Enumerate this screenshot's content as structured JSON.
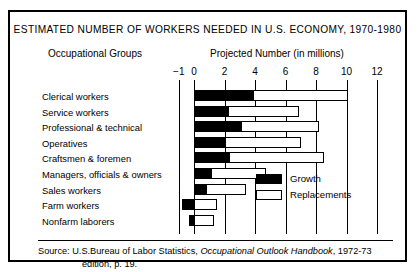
{
  "title": "ESTIMATED NUMBER OF WORKERS NEEDED IN U.S. ECONOMY, 1970-1980",
  "subheads": {
    "left": "Occupational Groups",
    "right": "Projected Number (in millions)"
  },
  "legend": {
    "growth_label": "Growth",
    "replacements_label": "Replacements"
  },
  "source": {
    "prefix": "Source:",
    "agency": "U.S.Bureau of Labor Statistics,",
    "publication": "Occupational Outlook Handbook",
    "edition": ", 1972-73",
    "line2": "edition, p. 19."
  },
  "chart_data": {
    "type": "bar",
    "orientation": "horizontal",
    "stacked": true,
    "title": "ESTIMATED NUMBER OF WORKERS NEEDED IN U.S. ECONOMY, 1970-1980",
    "xlabel": "Projected Number (in millions)",
    "ylabel": "Occupational Groups",
    "xlim": [
      -1,
      12
    ],
    "xticks": [
      -1,
      0,
      2,
      4,
      6,
      8,
      10,
      12
    ],
    "xticklabels": [
      "−1",
      "0",
      "2",
      "4",
      "6",
      "8",
      "10",
      "12"
    ],
    "grid": true,
    "legend_position": "inside-right",
    "categories": [
      "Clerical workers",
      "Service workers",
      "Professional & technical",
      "Operatives",
      "Craftsmen & foremen",
      "Managers, officials & owners",
      "Sales workers",
      "Farm workers",
      "Nonfarm laborers"
    ],
    "series": [
      {
        "name": "Growth",
        "color": "#000000",
        "values": [
          3.9,
          2.2,
          3.1,
          2.0,
          2.3,
          1.1,
          0.8,
          -0.8,
          -0.3
        ]
      },
      {
        "name": "Replacements",
        "color": "#ffffff",
        "values": [
          6.2,
          4.7,
          5.1,
          5.0,
          6.2,
          3.6,
          2.6,
          1.5,
          1.3
        ]
      }
    ],
    "totals": [
      10.1,
      6.9,
      8.2,
      7.0,
      8.5,
      4.7,
      3.4,
      0.7,
      1.0
    ]
  }
}
